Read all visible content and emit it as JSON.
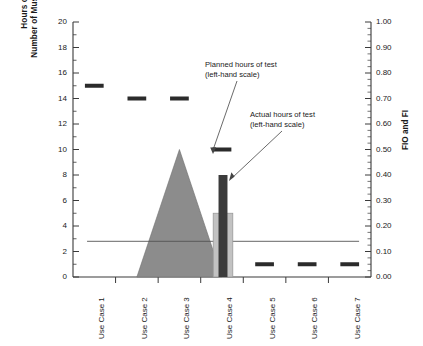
{
  "chart_data": {
    "type": "bar",
    "title": "",
    "categories": [
      "Use Case 1",
      "Use Case 2",
      "Use Case 3",
      "Use Case 4",
      "Use Case 5",
      "Use Case 6",
      "Use Case 7"
    ],
    "xlabel": "",
    "ylabel": "Hours of Test / Number of Must-Fix Defects",
    "ylabel_line1": "Hours of Test",
    "ylabel_line2": "Number of Must-Fix Defects",
    "ylabel_right": "FIO and FI",
    "ylim": [
      0,
      20
    ],
    "ytick_labels": [
      "0",
      "2",
      "4",
      "6",
      "8",
      "10",
      "12",
      "14",
      "16",
      "18",
      "20"
    ],
    "ytick_values": [
      0,
      2,
      4,
      6,
      8,
      10,
      12,
      14,
      16,
      18,
      20
    ],
    "y2lim": [
      0.0,
      1.0
    ],
    "y2tick_labels": [
      "0.00",
      "0.10",
      "0.20",
      "0.30",
      "0.40",
      "0.50",
      "0.60",
      "0.70",
      "0.80",
      "0.90",
      "1.00"
    ],
    "y2tick_values": [
      0.0,
      0.1,
      0.2,
      0.3,
      0.4,
      0.5,
      0.6,
      0.7,
      0.8,
      0.9,
      1.0
    ],
    "grid": false,
    "legend_position": "none",
    "series": [
      {
        "name": "Planned hours of test",
        "type": "dash-marker",
        "axis": "left",
        "color": "#2b2b2b",
        "values": [
          15,
          14,
          14,
          10,
          1,
          1,
          1
        ]
      },
      {
        "name": "Actual hours of test",
        "type": "bar",
        "axis": "left",
        "color": "#3b3b3b",
        "values": [
          null,
          null,
          null,
          8,
          null,
          null,
          null
        ]
      },
      {
        "name": "Must-fix defects",
        "type": "bar",
        "axis": "left",
        "color": "#c2c2c2",
        "values": [
          null,
          null,
          null,
          5,
          null,
          null,
          null
        ]
      },
      {
        "name": "Defect density profile",
        "type": "area",
        "axis": "left",
        "color": "#8c8c8c",
        "x": [
          2,
          3,
          4
        ],
        "values": [
          0,
          10,
          0
        ]
      },
      {
        "name": "Threshold",
        "type": "hline",
        "axis": "left",
        "color": "#555555",
        "value": 2.8,
        "value_right_scale": 0.14
      }
    ],
    "annotations": [
      {
        "name": "planned-hours-callout",
        "line1": "Planned hours of test",
        "line2": "(left-hand scale)",
        "target_category": "Use Case 4",
        "target_value": 10
      },
      {
        "name": "actual-hours-callout",
        "line1": "Actual hours of test",
        "line2": "(left-hand scale)",
        "target_category": "Use Case 4",
        "target_value": 8
      }
    ]
  }
}
